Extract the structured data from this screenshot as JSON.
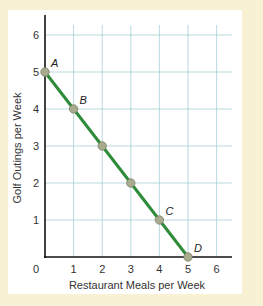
{
  "chart_data": {
    "type": "line",
    "title": "",
    "xlabel": "Restaurant Meals per Week",
    "ylabel": "Golf Outings per Week",
    "xlim": [
      0,
      6.6
    ],
    "ylim": [
      0,
      6.4
    ],
    "x_ticks": [
      "0",
      "1",
      "2",
      "3",
      "4",
      "5",
      "6"
    ],
    "y_ticks": [
      "1",
      "2",
      "3",
      "4",
      "5",
      "6"
    ],
    "grid": true,
    "legend": null,
    "series": [
      {
        "name": "Production possibilities",
        "color": "#2e8b3a",
        "points": [
          {
            "x": 0,
            "y": 5,
            "label": "A"
          },
          {
            "x": 1,
            "y": 4,
            "label": "B"
          },
          {
            "x": 2,
            "y": 3,
            "label": ""
          },
          {
            "x": 3,
            "y": 2,
            "label": ""
          },
          {
            "x": 4,
            "y": 1,
            "label": "C"
          },
          {
            "x": 5,
            "y": 0,
            "label": "D"
          }
        ]
      }
    ]
  },
  "colors": {
    "background": "#f8f1d3",
    "panel": "#ffffff",
    "grid": "#a9cfd6",
    "axis": "#111111",
    "line": "#2e8b3a",
    "marker": "#a9ab8e"
  }
}
